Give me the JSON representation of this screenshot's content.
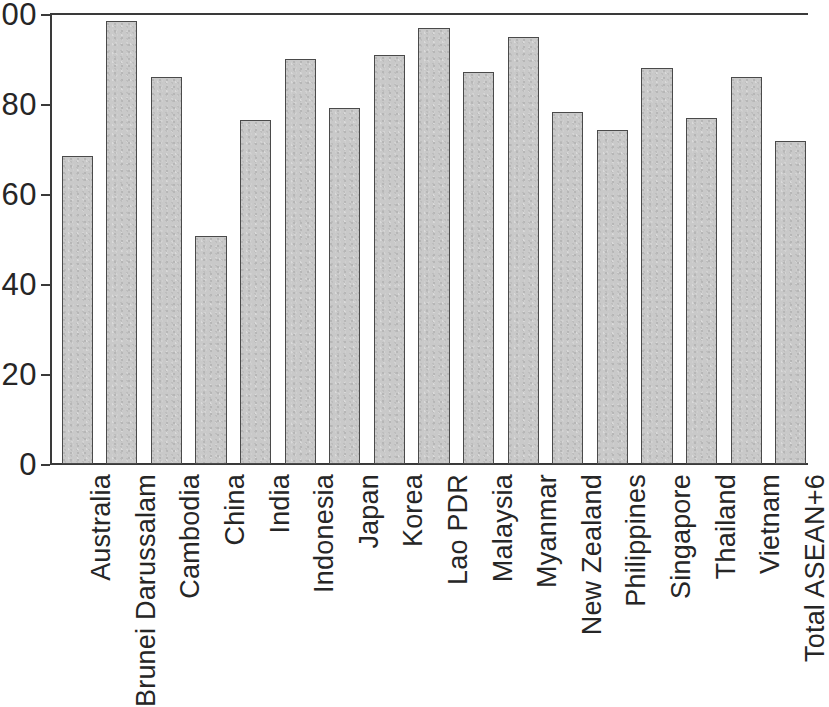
{
  "chart_data": {
    "type": "bar",
    "title": "",
    "subtitle": "",
    "xlabel": "",
    "ylabel": "",
    "ylim": [
      0,
      100
    ],
    "yticks": [
      0,
      20,
      40,
      60,
      80,
      100
    ],
    "ytick_labels": [
      "0",
      "20",
      "40",
      "60",
      "80",
      "100"
    ],
    "grid": false,
    "legend": null,
    "legend_position": "none",
    "orientation": "vertical",
    "tick_label_rotation": 90,
    "bar_color": "#c9c9c9",
    "bar_edge_color": "#4a4a4a",
    "axis_color": "#3a3a3a",
    "categories": [
      "Australia",
      "Brunei Darussalam",
      "Cambodia",
      "China",
      "India",
      "Indonesia",
      "Japan",
      "Korea",
      "Lao PDR",
      "Malaysia",
      "Myanmar",
      "New Zealand",
      "Philippines",
      "Singapore",
      "Thailand",
      "Vietnam",
      "Total ASEAN+6"
    ],
    "values": [
      68.5,
      98.5,
      86.0,
      50.7,
      76.5,
      90.0,
      79.2,
      91.0,
      97.0,
      87.2,
      94.8,
      78.3,
      74.2,
      88.0,
      77.0,
      86.0,
      71.7
    ]
  }
}
